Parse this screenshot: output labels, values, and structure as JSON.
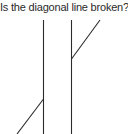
{
  "question": "Is the diagonal line broken?",
  "figure": {
    "name": "poggendorff-illusion",
    "line_color": "#2b2b2b",
    "vertical_left": {
      "x1": 43.5,
      "y1": 20,
      "x2": 43.5,
      "y2": 134
    },
    "vertical_right": {
      "x1": 71.5,
      "y1": 20,
      "x2": 71.5,
      "y2": 134
    },
    "diagonal_upper": {
      "x1": 71.5,
      "y1": 59,
      "x2": 100,
      "y2": 20
    },
    "diagonal_lower": {
      "x1": 43.5,
      "y1": 99,
      "x2": 17,
      "y2": 134
    }
  }
}
